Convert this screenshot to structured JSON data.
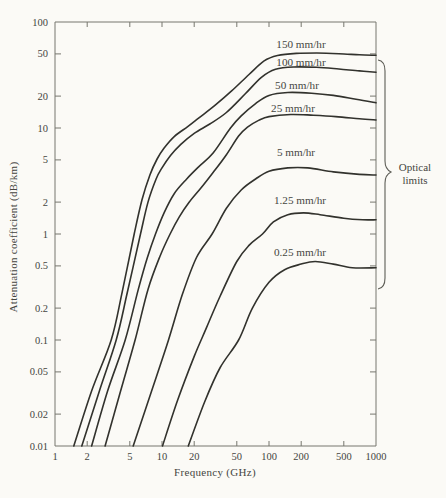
{
  "page": {
    "background": "#fbfaf6"
  },
  "chart_data": {
    "type": "line",
    "title": "",
    "xlabel": "Frequency (GHz)",
    "ylabel": "Attenuation coefficient (dB/km)",
    "x_scale": "log",
    "y_scale": "log",
    "xlim": [
      1,
      1000
    ],
    "ylim": [
      0.01,
      100
    ],
    "grid": false,
    "legend_position": "inline-labels",
    "x_ticks": [
      "1",
      "2",
      "5",
      "10",
      "20",
      "50",
      "100",
      "200",
      "500",
      "1000"
    ],
    "y_ticks": [
      "100",
      "50",
      "20",
      "10",
      "5",
      "2",
      "1",
      "0.5",
      "0.2",
      "0.1",
      "0.05",
      "0.02",
      "0.01"
    ],
    "series": [
      {
        "name": "150 mm/hr",
        "label_pos": [
          301,
          44
        ],
        "points": [
          [
            1.5,
            0.01
          ],
          [
            2.2,
            0.033
          ],
          [
            3.35,
            0.1
          ],
          [
            4.2,
            0.27
          ],
          [
            5.5,
            1.0
          ],
          [
            6.5,
            2.1
          ],
          [
            7.7,
            3.6
          ],
          [
            9,
            5.1
          ],
          [
            10.5,
            6.5
          ],
          [
            13,
            8.3
          ],
          [
            17.4,
            10.3
          ],
          [
            22,
            12.4
          ],
          [
            31.6,
            16.5
          ],
          [
            45,
            22.5
          ],
          [
            65,
            32
          ],
          [
            90,
            43
          ],
          [
            120,
            48.3
          ],
          [
            180,
            50.6
          ],
          [
            280,
            51
          ],
          [
            450,
            50.2
          ],
          [
            700,
            49
          ],
          [
            1000,
            48.5
          ]
        ]
      },
      {
        "name": "100 mm/hr",
        "label_pos": [
          301,
          62
        ],
        "points": [
          [
            1.78,
            0.01
          ],
          [
            2.6,
            0.033
          ],
          [
            3.73,
            0.1
          ],
          [
            4.7,
            0.27
          ],
          [
            6.3,
            1.0
          ],
          [
            7.4,
            2.0
          ],
          [
            8.8,
            3.3
          ],
          [
            10,
            4.2
          ],
          [
            12,
            5.5
          ],
          [
            15,
            7.0
          ],
          [
            20,
            8.9
          ],
          [
            28,
            10.9
          ],
          [
            40,
            14
          ],
          [
            60,
            21
          ],
          [
            85,
            30
          ],
          [
            115,
            35.8
          ],
          [
            170,
            37.6
          ],
          [
            280,
            37.4
          ],
          [
            450,
            36
          ],
          [
            700,
            34.6
          ],
          [
            1000,
            33.6
          ]
        ]
      },
      {
        "name": "50 mm/hr",
        "label_pos": [
          297,
          85
        ],
        "points": [
          [
            2.2,
            0.01
          ],
          [
            3.1,
            0.033
          ],
          [
            4.53,
            0.1
          ],
          [
            6,
            0.3
          ],
          [
            7.3,
            0.6
          ],
          [
            8.7,
            1.0
          ],
          [
            10.5,
            1.6
          ],
          [
            13,
            2.4
          ],
          [
            17,
            3.3
          ],
          [
            22,
            4.3
          ],
          [
            30,
            5.8
          ],
          [
            43.7,
            10
          ],
          [
            55,
            13
          ],
          [
            75,
            17
          ],
          [
            100,
            20.3
          ],
          [
            150,
            21.6
          ],
          [
            250,
            21.3
          ],
          [
            400,
            20.3
          ],
          [
            650,
            18.7
          ],
          [
            1000,
            17.3
          ]
        ]
      },
      {
        "name": "25 mm/hr",
        "label_pos": [
          293,
          108
        ],
        "points": [
          [
            2.94,
            0.01
          ],
          [
            4.1,
            0.033
          ],
          [
            5.6,
            0.1
          ],
          [
            7.4,
            0.3
          ],
          [
            9.6,
            0.62
          ],
          [
            11.9,
            1.0
          ],
          [
            14.5,
            1.45
          ],
          [
            18,
            2.0
          ],
          [
            23,
            2.7
          ],
          [
            30,
            3.8
          ],
          [
            40,
            5.6
          ],
          [
            52,
            8.4
          ],
          [
            63,
            10.2
          ],
          [
            80,
            11.8
          ],
          [
            100,
            12.8
          ],
          [
            160,
            13.4
          ],
          [
            260,
            13.2
          ],
          [
            420,
            12.8
          ],
          [
            700,
            12.2
          ],
          [
            1000,
            11.9
          ]
        ]
      },
      {
        "name": "5 mm/hr",
        "label_pos": [
          296,
          152
        ],
        "points": [
          [
            5.38,
            0.01
          ],
          [
            8,
            0.033
          ],
          [
            11.5,
            0.1
          ],
          [
            15.5,
            0.27
          ],
          [
            21,
            0.6
          ],
          [
            29.4,
            1.0
          ],
          [
            40,
            1.75
          ],
          [
            55,
            2.6
          ],
          [
            75,
            3.3
          ],
          [
            100,
            3.9
          ],
          [
            150,
            4.2
          ],
          [
            230,
            4.2
          ],
          [
            400,
            3.85
          ],
          [
            700,
            3.65
          ],
          [
            1000,
            3.6
          ]
        ]
      },
      {
        "name": "1.25 mm/hr",
        "label_pos": [
          300,
          200
        ],
        "points": [
          [
            10.1,
            0.01
          ],
          [
            14,
            0.027
          ],
          [
            20,
            0.07
          ],
          [
            26,
            0.13
          ],
          [
            35,
            0.26
          ],
          [
            50,
            0.55
          ],
          [
            65,
            0.78
          ],
          [
            87,
            1.0
          ],
          [
            110,
            1.3
          ],
          [
            150,
            1.52
          ],
          [
            210,
            1.58
          ],
          [
            300,
            1.52
          ],
          [
            500,
            1.41
          ],
          [
            750,
            1.36
          ],
          [
            1000,
            1.36
          ]
        ]
      },
      {
        "name": "0.25 mm/hr",
        "label_pos": [
          300,
          252
        ],
        "points": [
          [
            17.6,
            0.01
          ],
          [
            25,
            0.026
          ],
          [
            35,
            0.055
          ],
          [
            52,
            0.1
          ],
          [
            70,
            0.2
          ],
          [
            100,
            0.35
          ],
          [
            140,
            0.46
          ],
          [
            200,
            0.52
          ],
          [
            270,
            0.55
          ],
          [
            400,
            0.52
          ],
          [
            600,
            0.48
          ],
          [
            1000,
            0.48
          ]
        ]
      }
    ],
    "annotation": {
      "line1": "Optical",
      "line2": "limits",
      "brace": {
        "x": 378,
        "y_top": 60,
        "y_bottom": 289,
        "tip_y": 172
      }
    },
    "colors": {
      "curve": "#32322d",
      "frame": "#77776f",
      "text": "#45453f"
    }
  }
}
